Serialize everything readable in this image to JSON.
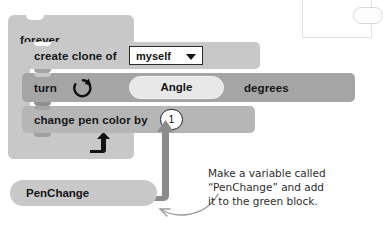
{
  "canvas": {
    "width": 364,
    "height": 228,
    "background": "#ffffff"
  },
  "palette": {
    "forever_block": "#c8c8c8",
    "clone_block": "#c8c8c8",
    "turn_block": "#a5a5a5",
    "pen_block": "#b6b6b6",
    "variable_pill": "#c8c8c8",
    "angle_slot": "#e8e8e8",
    "input_white": "#ffffff",
    "text_dark": "#161616",
    "annotation_text": "#2e2e2e",
    "connector_arrow": "#8c8c8c",
    "annotation_arrow": "#9a9a9a"
  },
  "script": {
    "forever": {
      "label": "forever",
      "loop_arrow_icon": "loop-back-arrow-icon"
    },
    "blocks": [
      {
        "id": "create-clone",
        "label": "create clone of",
        "dropdown": {
          "value": "myself",
          "caret_icon": "chevron-down-icon"
        }
      },
      {
        "id": "turn-right",
        "label": "turn",
        "icon": "turn-clockwise-icon",
        "slot_value": "Angle",
        "suffix": "degrees"
      },
      {
        "id": "change-pen-color",
        "label": "change pen color by",
        "value": "1"
      }
    ]
  },
  "variable": {
    "name": "PenChange"
  },
  "annotation": {
    "lines": [
      "Make a variable called",
      "“PenChange” and add",
      "it to the green block."
    ],
    "pointer_icon": "curved-arrow-icon",
    "connector_icon": "thick-bent-arrow-icon"
  },
  "corner_panel": {
    "pill_icon": "rounded-pill-icon"
  }
}
